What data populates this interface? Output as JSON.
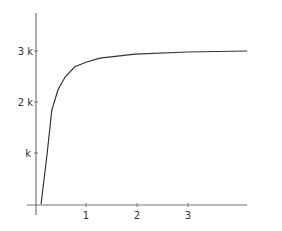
{
  "chart_data": {
    "type": "line",
    "title": "",
    "xlabel": "",
    "ylabel": "",
    "x_ticks": [
      "1",
      "2",
      "3"
    ],
    "y_ticks": [
      "k",
      "2 k",
      "3 k"
    ],
    "xlim": [
      0,
      4.2
    ],
    "ylim": [
      0,
      3750
    ],
    "grid": false,
    "legend": null,
    "series": [
      {
        "name": "curve",
        "x": [
          0.12,
          0.24,
          0.33,
          0.45,
          0.59,
          0.78,
          1.0,
          1.27,
          1.96,
          3.0,
          4.16
        ],
        "y": [
          0,
          1000,
          1840,
          2240,
          2490,
          2690,
          2780,
          2860,
          2940,
          2980,
          3000
        ]
      }
    ],
    "colors": {
      "axis": "#666666",
      "line": "#333333"
    }
  }
}
